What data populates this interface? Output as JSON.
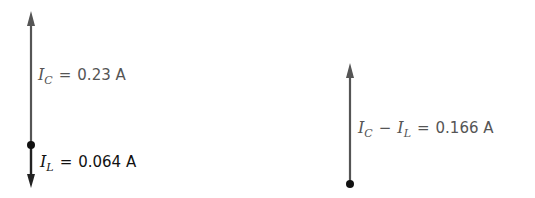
{
  "diagram": {
    "left": {
      "ic": {
        "symbol": "I",
        "sub": "C",
        "op": "=",
        "value": "0.23 A"
      },
      "il": {
        "symbol": "I",
        "sub": "L",
        "op": "=",
        "value": "0.064 A"
      }
    },
    "right": {
      "diff": {
        "symbol1": "I",
        "sub1": "C",
        "minus": "−",
        "symbol2": "I",
        "sub2": "L",
        "op": "=",
        "value": "0.166 A"
      }
    },
    "colors": {
      "phasor": "#555555",
      "dot": "#111111",
      "il_arrow": "#222222"
    }
  }
}
